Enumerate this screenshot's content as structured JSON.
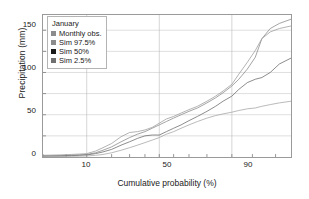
{
  "chart_data": {
    "type": "line",
    "title": "",
    "subtitle": "",
    "xlabel": "Cumulative probability (%)",
    "ylabel": "Precipitation (mm)",
    "x_scale": "normal-probability",
    "xlim": [
      2,
      99
    ],
    "ylim": [
      0,
      168
    ],
    "x_ticklabels": [
      "10",
      "50",
      "90"
    ],
    "x_tickvalues": [
      10,
      50,
      90
    ],
    "y_ticklabels": [
      "0",
      "50",
      "100",
      "150"
    ],
    "y_tickvalues": [
      0,
      50,
      100,
      150
    ],
    "y_minor_tickvalues": [
      25,
      75,
      125
    ],
    "grid": "both-minor-horizontal-and-major-vertical",
    "legend_position": "top-left-inside",
    "legend_title": "January",
    "series": [
      {
        "name": "Monthly obs.",
        "color": "#8c8c8c",
        "swatch": "#8c8c8c",
        "x": [
          2,
          4,
          6,
          8,
          10,
          13,
          16,
          20,
          25,
          30,
          35,
          40,
          45,
          50,
          55,
          60,
          65,
          70,
          75,
          80,
          84,
          87,
          90,
          92,
          94,
          95.5,
          96.5,
          97.5,
          98.3,
          99
        ],
        "y": [
          1,
          1.5,
          2,
          2.5,
          3,
          5,
          8,
          12,
          18,
          23,
          27,
          30,
          34,
          38,
          42,
          46,
          50,
          54,
          58,
          64,
          70,
          76,
          84,
          92,
          104,
          118,
          140,
          152,
          158,
          163
        ]
      },
      {
        "name": "Sim 97.5%",
        "color": "#9e9e9e",
        "swatch": "#8c8c8c",
        "x": [
          2,
          4,
          6,
          8,
          10,
          13,
          16,
          20,
          25,
          30,
          35,
          40,
          45,
          50,
          55,
          60,
          65,
          70,
          75,
          80,
          84,
          87,
          90,
          92,
          94,
          95.5,
          96.5,
          97.5,
          98.3,
          99
        ],
        "y": [
          2,
          2.5,
          3,
          3.5,
          4,
          7,
          11,
          16,
          24,
          29,
          30,
          32,
          35,
          40,
          45,
          48,
          52,
          56,
          60,
          66,
          72,
          78,
          86,
          98,
          112,
          126,
          140,
          148,
          152,
          155
        ]
      },
      {
        "name": "Sim 50%",
        "color": "#6e6e6e",
        "swatch": "#1a1a1a",
        "x": [
          2,
          4,
          6,
          8,
          10,
          13,
          16,
          20,
          25,
          30,
          35,
          40,
          45,
          50,
          55,
          60,
          65,
          70,
          75,
          80,
          84,
          87,
          90,
          92,
          94,
          95.5,
          96.5,
          97.5,
          98.3,
          99
        ],
        "y": [
          1,
          1.2,
          1.6,
          2,
          2.4,
          4,
          6,
          9,
          14,
          18,
          22,
          25,
          26,
          26,
          30,
          34,
          38,
          43,
          48,
          54,
          60,
          66,
          72,
          80,
          88,
          92,
          94,
          100,
          110,
          117
        ]
      },
      {
        "name": "Sim 2.5%",
        "color": "#a8a8a8",
        "swatch": "#707070",
        "x": [
          2,
          4,
          6,
          8,
          10,
          13,
          16,
          20,
          25,
          30,
          35,
          40,
          45,
          50,
          55,
          60,
          65,
          70,
          75,
          80,
          84,
          87,
          90,
          92,
          94,
          95.5,
          96.5,
          97.5,
          98.3,
          99
        ],
        "y": [
          0.5,
          0.6,
          0.8,
          1,
          1.2,
          2,
          3,
          5,
          8,
          11,
          14,
          17,
          20,
          23,
          27,
          30,
          34,
          38,
          42,
          46,
          49,
          51,
          53,
          55,
          57,
          58,
          60,
          62,
          64,
          66
        ]
      }
    ]
  },
  "axes": {
    "ylabel": "Precipitation (mm)",
    "xlabel": "Cumulative probability (%)",
    "yticks": [
      "0",
      "50",
      "100",
      "150"
    ],
    "xticks": [
      "10",
      "50",
      "90"
    ]
  },
  "legend": {
    "title": "January",
    "items": [
      {
        "label": "Monthly obs.",
        "color": "#8c8c8c"
      },
      {
        "label": "Sim 97.5%",
        "color": "#8c8c8c"
      },
      {
        "label": "Sim 50%",
        "color": "#1a1a1a"
      },
      {
        "label": "Sim 2.5%",
        "color": "#707070"
      }
    ]
  }
}
